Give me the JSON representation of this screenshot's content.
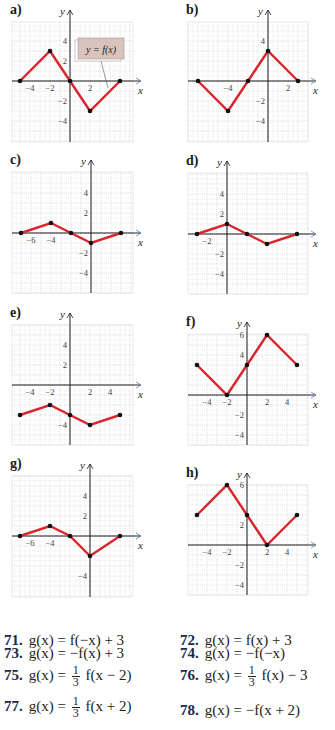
{
  "panels": [
    {
      "id": "a",
      "label": "a)",
      "origin": [
        70,
        81
      ],
      "grid": [
        12,
        22,
        133,
        142
      ],
      "points": [
        [
          -5,
          0
        ],
        [
          -2,
          3
        ],
        [
          0,
          0
        ],
        [
          2,
          -3
        ],
        [
          5,
          0
        ]
      ],
      "xticks": [
        {
          "v": -4,
          "t": "−4"
        },
        {
          "v": -2,
          "t": "−2"
        },
        {
          "v": 2,
          "t": "2"
        }
      ],
      "yticks": [
        {
          "v": 4,
          "t": "4"
        },
        {
          "v": 2,
          "t": "2"
        },
        {
          "v": -2,
          "t": "−2"
        },
        {
          "v": -4,
          "t": "−4"
        }
      ],
      "callout": {
        "text": "y = f(x)",
        "bg": "#d9c3bd"
      }
    },
    {
      "id": "b",
      "label": "b)",
      "origin": [
        268,
        81
      ],
      "grid": [
        188,
        22,
        308,
        142
      ],
      "points": [
        [
          -7,
          0
        ],
        [
          -4,
          -3
        ],
        [
          -2,
          0
        ],
        [
          0,
          3
        ],
        [
          3,
          0
        ]
      ],
      "xticks": [
        {
          "v": -4,
          "t": "−4"
        },
        {
          "v": 2,
          "t": "2"
        }
      ],
      "yticks": [
        {
          "v": 4,
          "t": "4"
        },
        {
          "v": -2,
          "t": "−2"
        },
        {
          "v": -4,
          "t": "−4"
        }
      ]
    },
    {
      "id": "c",
      "label": "c)",
      "origin": [
        91,
        233
      ],
      "grid": [
        12,
        172,
        133,
        293
      ],
      "points": [
        [
          -7,
          0
        ],
        [
          -4,
          1
        ],
        [
          -2,
          0
        ],
        [
          0,
          -1
        ],
        [
          3,
          0
        ]
      ],
      "xticks": [
        {
          "v": -6,
          "t": "−6"
        },
        {
          "v": -4,
          "t": "−4"
        }
      ],
      "yticks": [
        {
          "v": 4,
          "t": "4"
        },
        {
          "v": 2,
          "t": "2"
        },
        {
          "v": -2,
          "t": "−2"
        },
        {
          "v": -4,
          "t": "−4"
        }
      ]
    },
    {
      "id": "d",
      "label": "d)",
      "origin": [
        227,
        234
      ],
      "grid": [
        188,
        173,
        308,
        294
      ],
      "points": [
        [
          -3,
          0
        ],
        [
          0,
          1
        ],
        [
          2,
          0
        ],
        [
          4,
          -1
        ],
        [
          7,
          0
        ]
      ],
      "xticks": [
        {
          "v": -2,
          "t": "−2"
        }
      ],
      "yticks": [
        {
          "v": 4,
          "t": "4"
        },
        {
          "v": 2,
          "t": "2"
        },
        {
          "v": -2,
          "t": "−2"
        },
        {
          "v": -4,
          "t": "−4"
        }
      ]
    },
    {
      "id": "e",
      "label": "e)",
      "origin": [
        70,
        385
      ],
      "grid": [
        12,
        325,
        133,
        445
      ],
      "points": [
        [
          -5,
          -3
        ],
        [
          -2,
          -2
        ],
        [
          0,
          -3
        ],
        [
          2,
          -4
        ],
        [
          5,
          -3
        ]
      ],
      "xticks": [
        {
          "v": -4,
          "t": "−4"
        },
        {
          "v": -2,
          "t": "−2"
        },
        {
          "v": 2,
          "t": "2"
        },
        {
          "v": 4,
          "t": "4"
        }
      ],
      "yticks": [
        {
          "v": 4,
          "t": "4"
        },
        {
          "v": 2,
          "t": "2"
        },
        {
          "v": -4,
          "t": "−4"
        }
      ]
    },
    {
      "id": "f",
      "label": "f)",
      "origin": [
        247,
        395
      ],
      "grid": [
        188,
        334,
        308,
        445
      ],
      "points": [
        [
          -5,
          3
        ],
        [
          -2,
          0
        ],
        [
          0,
          3
        ],
        [
          2,
          6
        ],
        [
          5,
          3
        ]
      ],
      "xticks": [
        {
          "v": -4,
          "t": "−4"
        },
        {
          "v": -2,
          "t": "−2"
        },
        {
          "v": 2,
          "t": "2"
        },
        {
          "v": 4,
          "t": "4"
        }
      ],
      "yticks": [
        {
          "v": 6,
          "t": "6"
        },
        {
          "v": 4,
          "t": "4"
        },
        {
          "v": -2,
          "t": "−2"
        },
        {
          "v": -4,
          "t": "−4"
        }
      ]
    },
    {
      "id": "g",
      "label": "g)",
      "origin": [
        90,
        536
      ],
      "grid": [
        12,
        476,
        133,
        597
      ],
      "points": [
        [
          -7,
          0
        ],
        [
          -4,
          1
        ],
        [
          -2,
          0
        ],
        [
          0,
          -2
        ],
        [
          3,
          0
        ]
      ],
      "xticks": [
        {
          "v": -6,
          "t": "−6"
        },
        {
          "v": -4,
          "t": "−4"
        }
      ],
      "yticks": [
        {
          "v": 4,
          "t": "4"
        },
        {
          "v": 2,
          "t": "2"
        },
        {
          "v": -4,
          "t": "−4"
        }
      ]
    },
    {
      "id": "h",
      "label": "h)",
      "origin": [
        247,
        545
      ],
      "grid": [
        188,
        485,
        308,
        595
      ],
      "points": [
        [
          -5,
          3
        ],
        [
          -2,
          6
        ],
        [
          0,
          3
        ],
        [
          2,
          0
        ],
        [
          5,
          3
        ]
      ],
      "xticks": [
        {
          "v": -4,
          "t": "−4"
        },
        {
          "v": -2,
          "t": "−2"
        },
        {
          "v": 2,
          "t": "2"
        },
        {
          "v": 4,
          "t": "4"
        }
      ],
      "yticks": [
        {
          "v": 6,
          "t": "6"
        },
        {
          "v": 2,
          "t": "2"
        },
        {
          "v": -2,
          "t": "−2"
        },
        {
          "v": -4,
          "t": "−4"
        }
      ]
    }
  ],
  "axis_labels": {
    "x": "x",
    "y": "y"
  },
  "colors": {
    "curve": "#d9262c",
    "grid": "#c9c9c9",
    "axis": "#231f20",
    "arrow_blue": "#5b7fc0",
    "dot": "#111111"
  },
  "exercises": [
    {
      "num": "71.",
      "pre": "g(x) = f(−x) + 3"
    },
    {
      "num": "72.",
      "pre": "g(x) = f(x) + 3"
    },
    {
      "num": "73.",
      "pre": "g(x) = −f(x) + 3"
    },
    {
      "num": "74.",
      "pre": "g(x) = −f(−x)"
    },
    {
      "num": "75.",
      "pre": "g(x) = ",
      "frac": [
        "1",
        "3"
      ],
      "post": " f(x − 2)"
    },
    {
      "num": "76.",
      "pre": "g(x) = ",
      "frac": [
        "1",
        "3"
      ],
      "post": " f(x) − 3"
    },
    {
      "num": "77.",
      "pre": "g(x) = ",
      "frac": [
        "1",
        "3"
      ],
      "post": " f(x + 2)"
    },
    {
      "num": "78.",
      "pre": "g(x) = −f(x + 2)"
    }
  ],
  "chart_data": [
    {
      "type": "line",
      "title": "a) y = f(x)",
      "x": [
        -5,
        -2,
        0,
        2,
        5
      ],
      "y": [
        0,
        3,
        0,
        -3,
        0
      ]
    },
    {
      "type": "line",
      "title": "b)",
      "x": [
        -7,
        -4,
        -2,
        0,
        3
      ],
      "y": [
        0,
        -3,
        0,
        3,
        0
      ]
    },
    {
      "type": "line",
      "title": "c)",
      "x": [
        -7,
        -4,
        -2,
        0,
        3
      ],
      "y": [
        0,
        1,
        0,
        -1,
        0
      ]
    },
    {
      "type": "line",
      "title": "d)",
      "x": [
        -3,
        0,
        2,
        4,
        7
      ],
      "y": [
        0,
        1,
        0,
        -1,
        0
      ]
    },
    {
      "type": "line",
      "title": "e)",
      "x": [
        -5,
        -2,
        0,
        2,
        5
      ],
      "y": [
        -3,
        -2,
        -3,
        -4,
        -3
      ]
    },
    {
      "type": "line",
      "title": "f)",
      "x": [
        -5,
        -2,
        0,
        2,
        5
      ],
      "y": [
        3,
        0,
        3,
        6,
        3
      ]
    },
    {
      "type": "line",
      "title": "g)",
      "x": [
        -7,
        -4,
        -2,
        0,
        3
      ],
      "y": [
        0,
        1,
        0,
        -2,
        0
      ]
    },
    {
      "type": "line",
      "title": "h)",
      "x": [
        -5,
        -2,
        0,
        2,
        5
      ],
      "y": [
        3,
        6,
        3,
        0,
        3
      ]
    }
  ]
}
